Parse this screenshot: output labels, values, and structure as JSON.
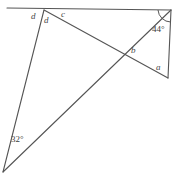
{
  "figure": {
    "stroke_color": "#555555",
    "background_color": "#ffffff",
    "labels": {
      "d_left": "d",
      "d_right": "d",
      "c": "c",
      "b": "b",
      "a": "a",
      "angle_44": "44°",
      "angle_32": "32°"
    },
    "geometry": {
      "points": {
        "top_left_end": [
          7,
          8
        ],
        "apex": [
          44,
          10
        ],
        "top_right": [
          171,
          10
        ],
        "bottom_left": [
          3,
          172
        ],
        "right_bottom": [
          168,
          78
        ],
        "crossing": [
          127,
          52
        ]
      },
      "segments": [
        {
          "name": "top-horizontal-line",
          "from": [
            7,
            8
          ],
          "to": [
            171,
            10
          ]
        },
        {
          "name": "apex-to-bottom-left",
          "from": [
            44,
            10
          ],
          "to": [
            3,
            172
          ]
        },
        {
          "name": "apex-to-right-bottom",
          "from": [
            44,
            10
          ],
          "to": [
            168,
            78
          ]
        },
        {
          "name": "bottom-left-to-top-right",
          "from": [
            3,
            172
          ],
          "to": [
            171,
            10
          ]
        },
        {
          "name": "right-vertical-side",
          "from": [
            171,
            10
          ],
          "to": [
            168,
            78
          ]
        }
      ],
      "right_angle_vertex": [
        171,
        10
      ],
      "marked_angles": [
        {
          "name": "angle-44-at-top-right",
          "value": "44°",
          "vertex": [
            171,
            10
          ]
        },
        {
          "name": "angle-32-at-bottom-left",
          "value": "32°",
          "vertex": [
            3,
            172
          ]
        }
      ]
    }
  }
}
